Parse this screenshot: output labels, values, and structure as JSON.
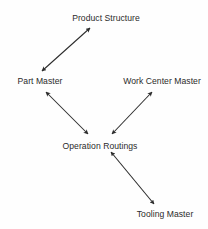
{
  "diagram": {
    "type": "entity-relationship-diagram",
    "background_color": "#fefefe",
    "line_color": "#2b2b2b",
    "text_color": "#2b2b2b",
    "nodes": [
      {
        "id": "product_structure",
        "label": "Product Structure",
        "cx": 106,
        "cy": 18
      },
      {
        "id": "part_master",
        "label": "Part Master",
        "cx": 40,
        "cy": 81
      },
      {
        "id": "work_center_master",
        "label": "Work Center Master",
        "cx": 162,
        "cy": 81
      },
      {
        "id": "operation_routings",
        "label": "Operation Routings",
        "cx": 100,
        "cy": 146
      },
      {
        "id": "tooling_master",
        "label": "Tooling Master",
        "cx": 165,
        "cy": 214
      }
    ],
    "edges": [
      {
        "id": "edge-part-master-product-structure",
        "from": "part_master",
        "to": "product_structure",
        "x1": 42,
        "y1": 71,
        "x2": 90,
        "y2": 28,
        "arrows": "both"
      },
      {
        "id": "edge-part-master-operation-routings",
        "from": "part_master",
        "to": "operation_routings",
        "x1": 46,
        "y1": 92,
        "x2": 88,
        "y2": 134,
        "arrows": "both"
      },
      {
        "id": "edge-work-center-operation-routings",
        "from": "work_center_master",
        "to": "operation_routings",
        "x1": 152,
        "y1": 92,
        "x2": 112,
        "y2": 134,
        "arrows": "both"
      },
      {
        "id": "edge-operation-routings-tooling",
        "from": "operation_routings",
        "to": "tooling_master",
        "x1": 111,
        "y1": 152,
        "x2": 154,
        "y2": 204,
        "arrows": "both"
      }
    ]
  }
}
